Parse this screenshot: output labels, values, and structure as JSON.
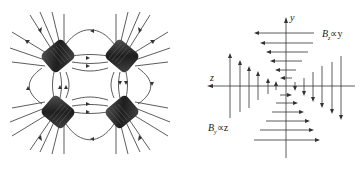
{
  "figure": {
    "left_panel": {
      "title": "Quadrupole coil magnetic field lines",
      "coils": 4,
      "colors": {
        "line": "#333333",
        "coil": "#2a2a2a"
      }
    },
    "right_panel": {
      "axes": {
        "y_label": "y",
        "z_label": "z"
      },
      "annotations": {
        "bz": "B",
        "bz_sub": "z",
        "bz_rel": "∝y",
        "by": "B",
        "by_sub": "y",
        "by_rel": "∝z"
      },
      "horizontal_arrows_above": {
        "direction": "left",
        "count": 6
      },
      "horizontal_arrows_below": {
        "direction": "right",
        "count": 6
      },
      "vertical_arrows_left": {
        "direction": "up",
        "count": 6
      },
      "vertical_arrows_right": {
        "direction": "down",
        "count": 6
      }
    },
    "caption": ""
  }
}
